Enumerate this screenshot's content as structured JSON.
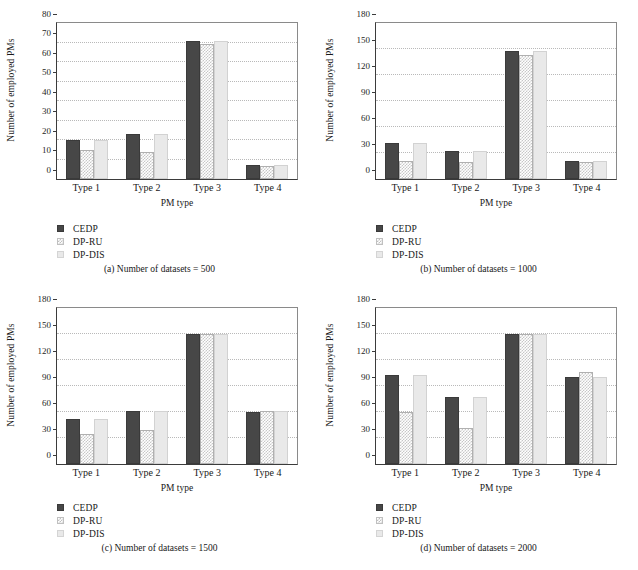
{
  "figure": {
    "series_names": [
      "CEDP",
      "DP-RU",
      "DP-DIS"
    ],
    "colors": {
      "cedp": "#474747",
      "dpru": "#ffffff",
      "dpdis": "#e9e9e9",
      "axis": "#3b3b3b",
      "grid": "#b9b9b9"
    }
  },
  "chart_data": [
    {
      "type": "bar",
      "id": "a",
      "title": "(a)  Number of datasets = 500",
      "caption": "(a)  Number of datasets = 500",
      "xlabel": "PM type",
      "ylabel": "Number of employed PMs",
      "categories": [
        "Type 1",
        "Type 2",
        "Type 3",
        "Type 4"
      ],
      "yticks": [
        0,
        10,
        20,
        30,
        40,
        50,
        60,
        70,
        80
      ],
      "ylim": [
        0,
        80
      ],
      "grid": true,
      "legend_position": "below-left",
      "series": [
        {
          "name": "CEDP",
          "values": [
            20,
            23,
            71,
            7
          ]
        },
        {
          "name": "DP-RU",
          "values": [
            15,
            14,
            69,
            6.5
          ]
        },
        {
          "name": "DP-DIS",
          "values": [
            20,
            23,
            71,
            7
          ]
        }
      ]
    },
    {
      "type": "bar",
      "id": "b",
      "title": "(b)  Number of datasets = 1000",
      "caption": "(b)  Number of datasets = 1000",
      "xlabel": "PM type",
      "ylabel": "Number of employed PMs",
      "categories": [
        "Type 1",
        "Type 2",
        "Type 3",
        "Type 4"
      ],
      "yticks": [
        0,
        30,
        60,
        90,
        120,
        150,
        180
      ],
      "ylim": [
        0,
        180
      ],
      "grid": true,
      "legend_position": "below-left",
      "series": [
        {
          "name": "CEDP",
          "values": [
            41,
            32,
            148,
            21
          ]
        },
        {
          "name": "DP-RU",
          "values": [
            21,
            20,
            143,
            20
          ]
        },
        {
          "name": "DP-DIS",
          "values": [
            41,
            32,
            148,
            21
          ]
        }
      ]
    },
    {
      "type": "bar",
      "id": "c",
      "title": "(c)  Number of datasets = 1500",
      "caption": "(c)  Number of datasets = 1500",
      "xlabel": "PM type",
      "ylabel": "Number of employed PMs",
      "categories": [
        "Type 1",
        "Type 2",
        "Type 3",
        "Type 4"
      ],
      "yticks": [
        0,
        30,
        60,
        90,
        120,
        150,
        180
      ],
      "ylim": [
        0,
        180
      ],
      "grid": true,
      "legend_position": "below-left",
      "series": [
        {
          "name": "CEDP",
          "values": [
            52,
            61,
            150,
            60
          ]
        },
        {
          "name": "DP-RU",
          "values": [
            35,
            39,
            150,
            61
          ]
        },
        {
          "name": "DP-DIS",
          "values": [
            52,
            61,
            150,
            61
          ]
        }
      ]
    },
    {
      "type": "bar",
      "id": "d",
      "title": "(d)  Number of datasets = 2000",
      "caption": "(d)  Number of datasets = 2000",
      "xlabel": "PM type",
      "ylabel": "Number of employed PMs",
      "categories": [
        "Type 1",
        "Type 2",
        "Type 3",
        "Type 4"
      ],
      "yticks": [
        0,
        30,
        60,
        90,
        120,
        150,
        180
      ],
      "ylim": [
        0,
        180
      ],
      "grid": true,
      "legend_position": "below-left",
      "series": [
        {
          "name": "CEDP",
          "values": [
            103,
            77,
            150,
            100
          ]
        },
        {
          "name": "DP-RU",
          "values": [
            60,
            41,
            150,
            106
          ]
        },
        {
          "name": "DP-DIS",
          "values": [
            103,
            77,
            150,
            100
          ]
        }
      ]
    }
  ]
}
